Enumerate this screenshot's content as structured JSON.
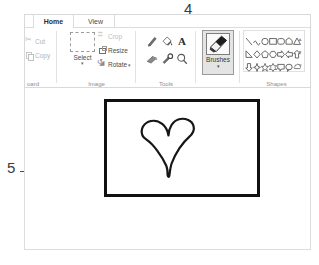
{
  "annotations": [
    {
      "id": "4",
      "label": "4",
      "target": "brushes-button"
    },
    {
      "id": "5",
      "label": "5",
      "target": "canvas-drawing"
    }
  ],
  "ribbon": {
    "tabs": [
      {
        "id": "home",
        "label": "Home",
        "active": true
      },
      {
        "id": "view",
        "label": "View",
        "active": false
      }
    ],
    "groups": [
      {
        "id": "clipboard",
        "label": "oard",
        "full_label": "Clipboard",
        "items": [
          {
            "id": "cut",
            "label": "Cut",
            "icon": "scissors-icon",
            "enabled": false
          },
          {
            "id": "copy",
            "label": "Copy",
            "icon": "copy-icon",
            "enabled": false
          }
        ]
      },
      {
        "id": "image",
        "label": "Image",
        "items": [
          {
            "id": "select",
            "label": "Select",
            "icon": "selection-rect-icon",
            "caret": "▾",
            "enabled": true
          },
          {
            "id": "crop",
            "label": "Crop",
            "icon": "crop-icon",
            "enabled": false
          },
          {
            "id": "resize",
            "label": "Resize",
            "icon": "resize-icon",
            "enabled": true
          },
          {
            "id": "rotate",
            "label": "Rotate",
            "icon": "rotate-icon",
            "caret": "▾",
            "enabled": true
          }
        ]
      },
      {
        "id": "tools",
        "label": "Tools",
        "items": [
          {
            "id": "pencil",
            "icon": "pencil-icon",
            "glyph": "╱"
          },
          {
            "id": "fill",
            "icon": "paint-bucket-icon",
            "glyph": "◤"
          },
          {
            "id": "text",
            "icon": "text-icon",
            "glyph": "A"
          },
          {
            "id": "eraser",
            "icon": "eraser-icon",
            "glyph": "▰"
          },
          {
            "id": "picker",
            "icon": "color-picker-icon",
            "glyph": "✐"
          },
          {
            "id": "magnifier",
            "icon": "magnifier-icon",
            "glyph": "⚲"
          }
        ]
      },
      {
        "id": "brushes",
        "label": "",
        "selected": true,
        "items": [
          {
            "id": "brushes",
            "label": "Brushes",
            "icon": "brush-icon",
            "caret": "▾",
            "selected": true
          }
        ]
      },
      {
        "id": "shapes",
        "label": "Shapes",
        "gallery_rows": [
          [
            "line-shape",
            "curve-shape",
            "oval-shape",
            "rectangle-shape",
            "rounded-rectangle-shape",
            "polygon-shape",
            "triangle-shape"
          ],
          [
            "right-triangle-shape",
            "diamond-shape",
            "pentagon-shape",
            "hexagon-shape",
            "right-arrow-shape",
            "left-arrow-shape",
            "up-arrow-shape"
          ],
          [
            "down-arrow-shape",
            "four-point-star-shape",
            "five-point-star-shape",
            "six-point-star-shape",
            "rounded-callout-shape",
            "oval-callout-shape",
            "cloud-callout-shape"
          ]
        ],
        "scroll": {
          "up": "▲",
          "mid": "▼",
          "down": "▾"
        }
      }
    ]
  },
  "canvas": {
    "drawing": "hand-drawn-heart",
    "border_color": "#111111",
    "background": "#ffffff"
  },
  "colors": {
    "selected_button_bg": "#e4e4e4",
    "selected_button_border": "#9b9b9b",
    "disabled_text": "#b4b4b4",
    "ribbon_border": "#d9d9d9",
    "ink": "#111111"
  }
}
